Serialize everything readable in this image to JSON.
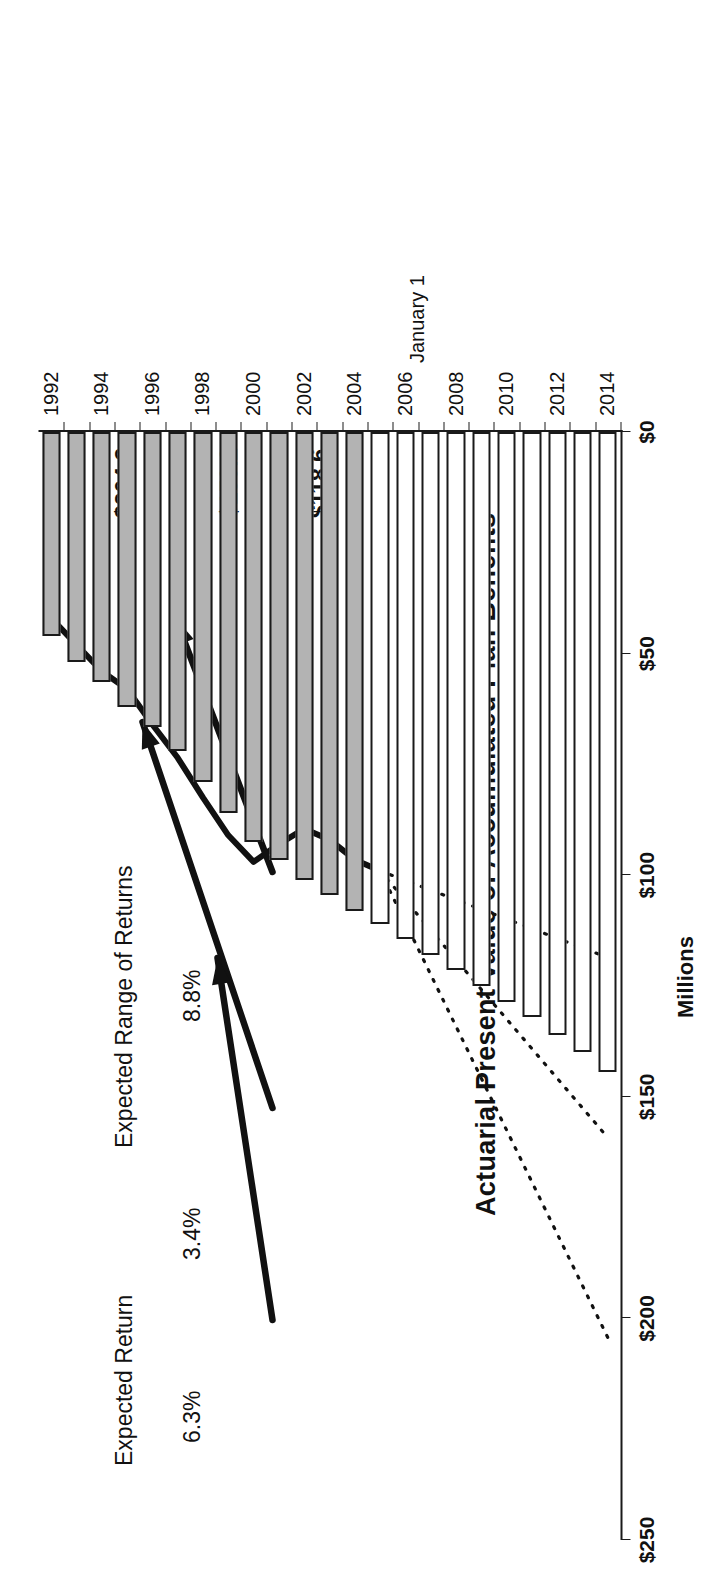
{
  "figure": {
    "chart_title": "Actuarial Present Value of Accumulated Plan Benefits",
    "value_axis_title": "Millions",
    "category_axis_title": "January 1"
  },
  "annotations": {
    "range_label": "Expected Range of Returns",
    "range_high": "8.8%",
    "range_low": "3.4%",
    "expected_label": "Expected Return",
    "expected_rate": "6.3%",
    "end_high": "$204.3",
    "end_mid": "$159.2",
    "end_low": "$118.6"
  },
  "chart_data": {
    "type": "bar",
    "orientation": "horizontal",
    "title": "Actuarial Present Value of Accumulated Plan Benefits",
    "xlabel": "Millions",
    "ylabel": "January 1",
    "xlim": [
      0,
      250
    ],
    "xticks": [
      0,
      50,
      100,
      150,
      200,
      250
    ],
    "xticklabels": [
      "$0",
      "$50",
      "$100",
      "$150",
      "$200",
      "$250"
    ],
    "grid": false,
    "legend": "none",
    "categories": [
      "1992",
      "1993",
      "1994",
      "1995",
      "1996",
      "1997",
      "1998",
      "1999",
      "2000",
      "2001",
      "2002",
      "2003",
      "2004",
      "2005",
      "2006",
      "2007",
      "2008",
      "2009",
      "2010",
      "2011",
      "2012",
      "2013",
      "2014"
    ],
    "category_labeled_ticks": [
      "1992",
      "1994",
      "1996",
      "1998",
      "2000",
      "2002",
      "2004",
      "2006",
      "2008",
      "2010",
      "2012",
      "2014"
    ],
    "series": [
      {
        "name": "Actuarial Present Value of Accumulated Plan Benefits",
        "style": "bar",
        "segments": [
          {
            "name": "Historical",
            "fill": "#b3b3b3",
            "from": "1992",
            "to": "2004"
          },
          {
            "name": "Projected",
            "fill": "#ffffff",
            "from": "2005",
            "to": "2014"
          }
        ],
        "values": [
          46.0,
          52.0,
          56.5,
          62.0,
          66.5,
          72.0,
          79.0,
          86.0,
          92.5,
          96.5,
          101.0,
          104.5,
          108.0,
          111.0,
          114.5,
          118.0,
          121.5,
          125.0,
          128.5,
          132.0,
          136.0,
          140.0,
          144.5
        ]
      },
      {
        "name": "Actual Market Value of Assets",
        "style": "line",
        "x": [
          "1992",
          "1993",
          "1994",
          "1995",
          "1996",
          "1997",
          "1998",
          "1999",
          "2000",
          "2001",
          "2002",
          "2003",
          "2004",
          "2005"
        ],
        "values": [
          42.0,
          48.0,
          54.0,
          58.0,
          66.0,
          73.5,
          82.5,
          91.0,
          97.0,
          93.0,
          89.5,
          92.0,
          96.5,
          99.0
        ]
      },
      {
        "name": "Projection at 8.8% (high)",
        "style": "dotted-line",
        "x": [
          "2005",
          "2014"
        ],
        "values": [
          99.0,
          204.3
        ],
        "end_label": "$204.3"
      },
      {
        "name": "Projection at 6.3% (expected)",
        "style": "dotted-line",
        "x": [
          "2005",
          "2014"
        ],
        "values": [
          99.0,
          159.2
        ],
        "end_label": "$159.2"
      },
      {
        "name": "Projection at 3.4% (low)",
        "style": "dotted-line",
        "x": [
          "2005",
          "2014"
        ],
        "values": [
          99.0,
          118.6
        ],
        "end_label": "$118.6"
      }
    ],
    "callouts": [
      {
        "text": "Expected Range of Returns",
        "points_to": [
          "8.8%",
          "3.4%"
        ]
      },
      {
        "text": "8.8%",
        "points_to": "Projection at 8.8% (high)"
      },
      {
        "text": "3.4%",
        "points_to": "Projection at 3.4% (low)"
      },
      {
        "text": "Expected Return",
        "points_to": "Projection at 6.3% (expected)"
      },
      {
        "text": "6.3%",
        "points_to": "Projection at 6.3% (expected)"
      }
    ]
  }
}
